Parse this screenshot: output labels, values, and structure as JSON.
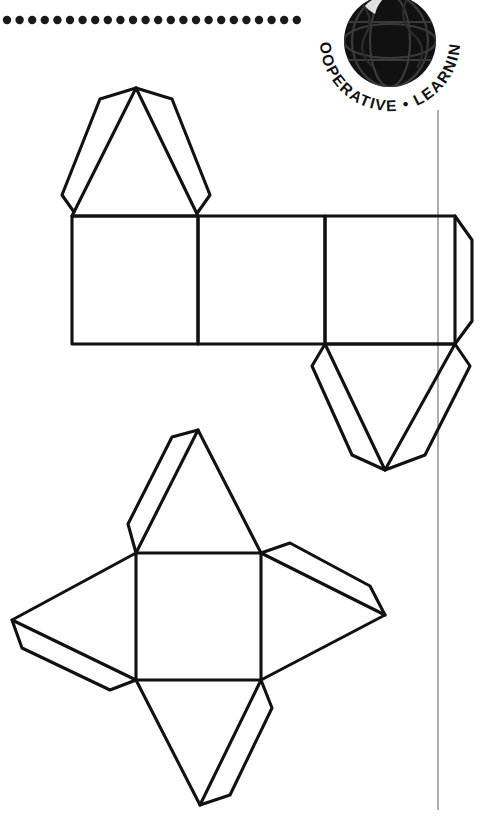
{
  "page": {
    "background_color": "#ffffff",
    "ink_color": "#111111",
    "width": 490,
    "height": 826
  },
  "decorations": {
    "dotted_rule": {
      "name": "dotted-rule",
      "description": "Horizontal row of round dots across the top-left of the page",
      "dot_count": 24,
      "dot_radius": 4.2,
      "dot_spacing": 12.6,
      "start_x": 5,
      "end_x": 295,
      "y": 20,
      "color": "#1a1a1a"
    },
    "margin_rule": {
      "name": "vertical-margin-rule",
      "description": "Thin grey vertical margin line on the right side of the page",
      "x": 438,
      "y_start": 110,
      "y_end": 810,
      "width": 1.4,
      "color": "#8c8c8c"
    }
  },
  "logo": {
    "name": "cooperative-learning-logo",
    "text": "COOPERATIVE • LEARNING",
    "globe_label": "globe-icon",
    "globe_color": "#111111",
    "text_color": "#111111",
    "center_x": 390,
    "center_y": 41,
    "globe_radius": 46,
    "text_radius": 64
  },
  "figures": [
    {
      "id": "triangular-prism-net",
      "name": "triangular-prism-net",
      "label": "Net of a triangular prism",
      "shape_type": "net",
      "parts": [
        {
          "part": "top-triangle-face",
          "kind": "triangle"
        },
        {
          "part": "left-square-face",
          "kind": "square"
        },
        {
          "part": "middle-square-face",
          "kind": "square"
        },
        {
          "part": "right-square-face",
          "kind": "square"
        },
        {
          "part": "bottom-triangle-face",
          "kind": "triangle"
        },
        {
          "part": "right-edge-glue-tab",
          "kind": "tab"
        },
        {
          "part": "top-triangle-left-tab",
          "kind": "tab"
        },
        {
          "part": "top-triangle-right-tab",
          "kind": "tab"
        },
        {
          "part": "bottom-triangle-left-tab",
          "kind": "tab"
        },
        {
          "part": "bottom-triangle-right-tab",
          "kind": "tab"
        }
      ]
    },
    {
      "id": "square-pyramid-net",
      "name": "square-pyramid-net",
      "label": "Net of a square pyramid",
      "shape_type": "net",
      "parts": [
        {
          "part": "base-square-face",
          "kind": "square"
        },
        {
          "part": "top-triangle-face",
          "kind": "triangle"
        },
        {
          "part": "right-triangle-face",
          "kind": "triangle"
        },
        {
          "part": "bottom-triangle-face",
          "kind": "triangle"
        },
        {
          "part": "left-triangle-face",
          "kind": "triangle"
        },
        {
          "part": "top-triangle-glue-tab",
          "kind": "tab"
        },
        {
          "part": "right-triangle-glue-tab",
          "kind": "tab"
        },
        {
          "part": "bottom-triangle-glue-tab",
          "kind": "tab"
        },
        {
          "part": "left-triangle-glue-tab",
          "kind": "tab"
        }
      ]
    }
  ],
  "geometry": {
    "prism": {
      "band_top": 216,
      "band_bottom": 344,
      "x0": 72,
      "x1": 198,
      "x2": 325,
      "x3": 455,
      "top_apex_x": 136,
      "top_apex_y": 88,
      "bottom_apex_x": 385,
      "bottom_apex_y": 470,
      "right_tab_x": 473
    },
    "pyramid": {
      "square_left": 136,
      "square_right": 261,
      "square_top": 553,
      "square_bottom": 680,
      "top_apex": [
        198,
        430
      ],
      "right_apex": [
        385,
        615
      ],
      "bottom_apex": [
        200,
        805
      ],
      "left_apex": [
        12,
        620
      ]
    }
  }
}
